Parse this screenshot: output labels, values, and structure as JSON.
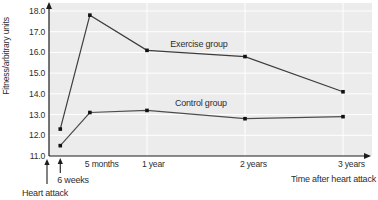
{
  "chart_data": {
    "type": "line",
    "title": "",
    "ylabel": "Fitness/arbitrary units",
    "xlabel": "Time after heart attack",
    "ylim": [
      11.0,
      18.0
    ],
    "ytick_step": 1.0,
    "ytick_labels": [
      "11.0",
      "12.0",
      "13.0",
      "14.0",
      "15.0",
      "16.0",
      "17.0",
      "18.0"
    ],
    "x_years": [
      0.115,
      0.417,
      1,
      2,
      3
    ],
    "x_ticks": [
      {
        "label": "5 months",
        "t": 0.417
      },
      {
        "label": "1 year",
        "t": 1
      },
      {
        "label": "2 years",
        "t": 2
      },
      {
        "label": "3 years",
        "t": 3
      }
    ],
    "vertical_gridlines_years": [
      1,
      2,
      3
    ],
    "grid": true,
    "legend_position": "inline-labels",
    "series": [
      {
        "name": "Exercise group",
        "values": [
          12.3,
          17.8,
          16.1,
          15.8,
          14.1
        ],
        "label_anchor": {
          "t": 1.53,
          "v": 16.4
        }
      },
      {
        "name": "Control group",
        "values": [
          11.5,
          13.1,
          13.2,
          12.8,
          12.9
        ],
        "label_anchor": {
          "t": 1.55,
          "v": 13.55
        }
      }
    ],
    "annotations": [
      {
        "name": "heart-attack",
        "label": "Heart attack",
        "t": 0
      },
      {
        "name": "six-weeks",
        "label": "6 weeks",
        "t": 0.115
      }
    ],
    "colors": {
      "plot_background": "#ececec",
      "gridline": "#ffffff",
      "axis": "#1c1c1c",
      "exercise_line": "#3d3d3d",
      "control_line": "#4d4d4d",
      "marker": "#111111",
      "text": "#2e2e2e"
    }
  }
}
